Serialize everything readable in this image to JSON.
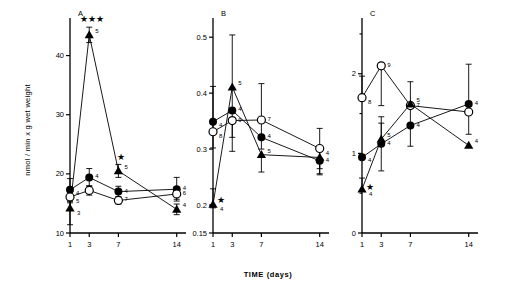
{
  "figure": {
    "x_axis_title": "TIME (days)",
    "y_axis_title": "nmol / min x g wet weight",
    "x_tick_labels": [
      "1",
      "3",
      "7",
      "14"
    ],
    "x_tick_values": [
      1,
      3,
      7,
      14
    ],
    "panel_labels": [
      "A",
      "B",
      "C"
    ],
    "significance_glyph": "★"
  },
  "chart_data": [
    {
      "type": "line",
      "title": "A",
      "xlabel": "TIME (days)",
      "ylabel": "nmol / min x g wet weight",
      "x": [
        1,
        3,
        7,
        14
      ],
      "xticklabels": [
        "1",
        "3",
        "7",
        "14"
      ],
      "ylim": [
        10,
        45
      ],
      "yticks": [
        10,
        20,
        30,
        40
      ],
      "yticklabels": [
        "10",
        "20",
        "30",
        "40"
      ],
      "grid": false,
      "legend": "none",
      "series": [
        {
          "name": "filled-circle",
          "marker": "filled-circle",
          "values": [
            17.3,
            19.4,
            17.0,
            17.4
          ],
          "err_up": [
            1.9,
            1.5,
            0.9,
            2.0
          ],
          "err_dn": [
            1.9,
            1.5,
            0.9,
            2.0
          ],
          "n": [
            "4",
            "4",
            "4",
            "4"
          ],
          "stars": [
            "",
            "",
            "",
            ""
          ]
        },
        {
          "name": "open-circle",
          "marker": "open-circle",
          "values": [
            16.1,
            17.2,
            15.5,
            16.6
          ],
          "err_up": [
            1.0,
            0.8,
            0.6,
            0.9
          ],
          "err_dn": [
            1.0,
            0.8,
            0.6,
            0.9
          ],
          "n": [
            "5",
            "",
            "7",
            "6"
          ],
          "stars": [
            "",
            "",
            "",
            ""
          ]
        },
        {
          "name": "filled-triangle",
          "marker": "filled-triangle",
          "values": [
            14.2,
            43.5,
            20.5,
            14.0
          ],
          "err_up": [
            1.2,
            1.3,
            1.1,
            0.9
          ],
          "err_dn": [
            2.8,
            1.3,
            1.1,
            0.9
          ],
          "n": [
            "3",
            "5",
            "5",
            "4"
          ],
          "stars": [
            "",
            "★★★",
            "★",
            ""
          ]
        }
      ]
    },
    {
      "type": "line",
      "title": "B",
      "xlabel": "TIME (days)",
      "ylabel": "",
      "x": [
        1,
        3,
        7,
        14
      ],
      "xticklabels": [
        "1",
        "3",
        "7",
        "14"
      ],
      "ylim": [
        0.15,
        0.52
      ],
      "yticks": [
        0.15,
        0.2,
        0.3,
        0.4,
        0.5
      ],
      "yticklabels": [
        "0.15",
        "0.2",
        "0.3",
        "0.4",
        "0.5"
      ],
      "grid": false,
      "legend": "none",
      "series": [
        {
          "name": "filled-circle",
          "marker": "filled-circle",
          "values": [
            0.349,
            0.369,
            0.321,
            0.279
          ],
          "err_up": [
            0.063,
            0.135,
            0.096,
            0.023
          ],
          "err_dn": [
            0.047,
            0.048,
            0.021,
            0.023
          ],
          "n": [
            "4",
            "4",
            "4",
            "4"
          ],
          "stars": [
            "",
            "",
            "",
            ""
          ]
        },
        {
          "name": "open-circle",
          "marker": "open-circle",
          "values": [
            0.331,
            0.351,
            0.352,
            0.301
          ],
          "err_up": [
            0.0,
            0.0,
            0.0,
            0.036
          ],
          "err_dn": [
            0.0,
            0.055,
            0.0,
            0.036
          ],
          "n": [
            "8",
            "9",
            "7",
            ""
          ],
          "stars": [
            "",
            "",
            "",
            ""
          ]
        },
        {
          "name": "filled-triangle",
          "marker": "filled-triangle",
          "values": [
            0.201,
            0.411,
            0.29,
            0.285
          ],
          "err_up": [
            0.028,
            0.0,
            0.0,
            0.0
          ],
          "err_dn": [
            0.006,
            0.0,
            0.031,
            0.031
          ],
          "n": [
            "4",
            "5",
            "5",
            "4"
          ],
          "stars": [
            "★",
            "",
            "",
            ""
          ]
        }
      ]
    },
    {
      "type": "line",
      "title": "C",
      "xlabel": "TIME (days)",
      "ylabel": "",
      "x": [
        1,
        3,
        7,
        14
      ],
      "xticklabels": [
        "1",
        "3",
        "7",
        "14"
      ],
      "ylim": [
        0,
        2.6
      ],
      "yticks": [
        0,
        1,
        2
      ],
      "yticklabels": [
        "0",
        "1",
        "2"
      ],
      "minor_yticks": [
        0.5,
        1.5,
        2.5
      ],
      "grid": false,
      "legend": "none",
      "series": [
        {
          "name": "filled-circle",
          "marker": "filled-circle",
          "values": [
            0.95,
            1.12,
            1.35,
            1.62
          ],
          "err_up": [
            0.0,
            0.26,
            0.26,
            0.5
          ],
          "err_dn": [
            0.0,
            0.34,
            0.26,
            0.38
          ],
          "n": [
            "4",
            "4",
            "4",
            "4"
          ],
          "stars": [
            "",
            "",
            "",
            ""
          ]
        },
        {
          "name": "open-circle",
          "marker": "open-circle",
          "values": [
            1.7,
            2.1,
            1.6,
            1.52
          ],
          "err_up": [
            0.27,
            0.0,
            0.0,
            0.0
          ],
          "err_dn": [
            0.0,
            0.5,
            0.0,
            0.0
          ],
          "n": [
            "8",
            "9",
            "7",
            ""
          ],
          "stars": [
            "",
            "",
            "",
            ""
          ]
        },
        {
          "name": "filled-triangle",
          "marker": "filled-triangle",
          "values": [
            0.55,
            1.18,
            1.62,
            1.1
          ],
          "err_up": [
            0.14,
            0.28,
            0.28,
            0.0
          ],
          "err_dn": [
            0.0,
            0.0,
            0.0,
            0.0
          ],
          "n": [
            "4",
            "5",
            "5",
            "4"
          ],
          "stars": [
            "★",
            "",
            "",
            ""
          ]
        }
      ]
    }
  ]
}
